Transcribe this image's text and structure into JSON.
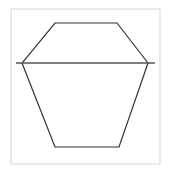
{
  "figure": {
    "canvas": {
      "width": 171,
      "height": 170,
      "background_color": "#ffffff"
    },
    "frame": {
      "name": "plot-frame",
      "x": 11,
      "y": 9,
      "width": 149,
      "height": 155,
      "stroke_color": "#d6d6d6",
      "stroke_width": 1,
      "fill_color": "#ffffff"
    },
    "shapes": [
      {
        "name": "hexagon",
        "type": "polygon",
        "closed": true,
        "stroke_color": "#333333",
        "stroke_width": 1.2,
        "fill_color": "none",
        "points": "55,23 117,23 148,63 119,147 55,147 22,63",
        "vertices": [
          {
            "label": "top-left",
            "x": 55,
            "y": 23
          },
          {
            "label": "top-right",
            "x": 117,
            "y": 23
          },
          {
            "label": "right",
            "x": 148,
            "y": 63
          },
          {
            "label": "bottom-right",
            "x": 119,
            "y": 147
          },
          {
            "label": "bottom-left",
            "x": 55,
            "y": 147
          },
          {
            "label": "left",
            "x": 22,
            "y": 63
          }
        ]
      },
      {
        "name": "horizontal-diagonal-line",
        "type": "line",
        "stroke_color": "#555555",
        "stroke_width": 1.4,
        "x1": 16,
        "y1": 63,
        "x2": 155,
        "y2": 63
      }
    ]
  },
  "chart_data": {
    "type": "scatter",
    "xlabel": "",
    "ylabel": "",
    "xlim": [
      11,
      160
    ],
    "ylim": [
      9,
      164
    ],
    "grid": false,
    "legend": "none",
    "series": [
      {
        "name": "hexagon outline",
        "draw": "closed polygon",
        "x": [
          55,
          117,
          148,
          119,
          55,
          22
        ],
        "y": [
          23,
          23,
          63,
          147,
          147,
          63
        ]
      },
      {
        "name": "horizontal line",
        "draw": "line",
        "x": [
          16,
          155
        ],
        "y": [
          63,
          63
        ]
      }
    ]
  }
}
